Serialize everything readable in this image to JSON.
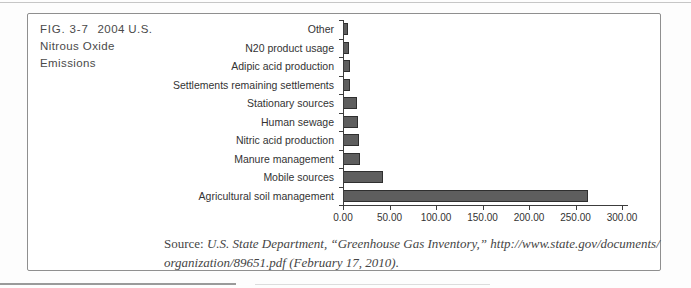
{
  "figure": {
    "label": "FIG. 3-7",
    "title_line1": "2004 U.S.",
    "title_line2": "Nitrous Oxide",
    "title_line3": "Emissions"
  },
  "chart_data": {
    "type": "bar",
    "orientation": "horizontal",
    "title": "2004 U.S. Nitrous Oxide Emissions",
    "categories": [
      "Other",
      "N20 product usage",
      "Adipic acid production",
      "Settlements remaining settlements",
      "Stationary sources",
      "Human sewage",
      "Nitric acid production",
      "Manure management",
      "Mobile sources",
      "Agricultural soil management"
    ],
    "values": [
      5,
      6,
      7,
      8,
      15,
      16,
      17,
      18,
      43,
      263
    ],
    "xlabel": "",
    "ylabel": "",
    "xlim": [
      0,
      300
    ],
    "xtick_labels": [
      "0.00",
      "50.00",
      "100.00",
      "150.00",
      "200.00",
      "250.00",
      "300.00"
    ],
    "grid": false,
    "legend": false,
    "bar_color": "#5e5e5e",
    "bar_border_color": "#2f2f2f",
    "axis_color": "#3c3c3c"
  },
  "source": {
    "prefix": "Source:",
    "line1": "U.S. State Department, “Greenhouse Gas Inventory,” http://www.state.gov/documents/",
    "line2": "organization/89651.pdf (February 17, 2010)."
  }
}
